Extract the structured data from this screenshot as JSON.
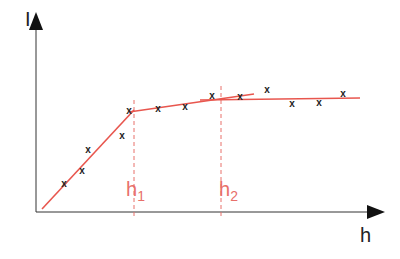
{
  "axes": {
    "y_label": "I",
    "x_label": "h"
  },
  "markers": [
    {
      "label": "h",
      "sub": "1",
      "x": 134
    },
    {
      "label": "h",
      "sub": "2",
      "x": 221
    }
  ],
  "colors": {
    "axis": "#222222",
    "fit": "#e8564e",
    "marker": "#e8706a",
    "point": "#222222"
  },
  "chart_data": {
    "type": "scatter",
    "title": "",
    "xlabel": "h",
    "ylabel": "I",
    "annotations": [
      "h1",
      "h2"
    ],
    "points_px": [
      [
        64,
        184
      ],
      [
        82,
        171
      ],
      [
        88,
        150
      ],
      [
        122,
        136
      ],
      [
        129,
        111
      ],
      [
        158,
        109
      ],
      [
        185,
        107
      ],
      [
        212,
        96
      ],
      [
        240,
        97
      ],
      [
        267,
        90
      ],
      [
        292,
        104
      ],
      [
        319,
        103
      ],
      [
        343,
        94
      ]
    ],
    "fit_segments_px": [
      [
        [
          42,
          209
        ],
        [
          134,
          110
        ]
      ],
      [
        [
          129,
          112
        ],
        [
          254,
          94
        ]
      ],
      [
        [
          200,
          100
        ],
        [
          360,
          98
        ]
      ]
    ]
  }
}
